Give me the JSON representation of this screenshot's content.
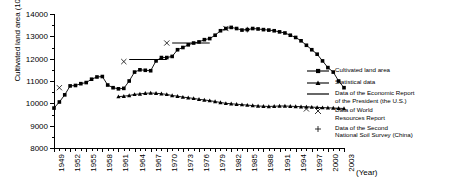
{
  "chart_data": {
    "type": "line",
    "title": "",
    "xlabel": "(Year)",
    "ylabel": "Cultivated land area (10000 hectares)",
    "ylim": [
      8000,
      14000
    ],
    "ytick_values": [
      8000,
      9000,
      10000,
      11000,
      12000,
      13000,
      14000
    ],
    "ytick_labels": [
      "8000",
      "9000",
      "10000",
      "11000",
      "12000",
      "13000",
      "14000"
    ],
    "xlim": [
      1949,
      2003
    ],
    "xtick_labels": [
      "1949",
      "1952",
      "1955",
      "1958",
      "1961",
      "1964",
      "1967",
      "1970",
      "1973",
      "1976",
      "1979",
      "1982",
      "1985",
      "1988",
      "1991",
      "1994",
      "1997",
      "2000",
      "2003"
    ],
    "grid": false,
    "legend_position": "right",
    "series": [
      {
        "name": "Cultivated land area",
        "marker": "square",
        "x": [
          1949,
          1950,
          1951,
          1952,
          1953,
          1954,
          1955,
          1956,
          1957,
          1958,
          1959,
          1960,
          1961,
          1962,
          1963,
          1964,
          1965,
          1966,
          1967,
          1968,
          1969,
          1970,
          1971,
          1972,
          1973,
          1974,
          1975,
          1976,
          1977,
          1978,
          1979,
          1980,
          1981,
          1982,
          1983,
          1984,
          1985,
          1986,
          1987,
          1988,
          1989,
          1990,
          1991,
          1992,
          1993,
          1994,
          1995,
          1996,
          1997,
          1998,
          1999,
          2000,
          2001,
          2002,
          2003
        ],
        "values": [
          9788,
          10060,
          10380,
          10780,
          10800,
          10880,
          10930,
          11080,
          11180,
          11200,
          10820,
          10700,
          10650,
          10670,
          11000,
          11400,
          11500,
          11480,
          11460,
          11900,
          12050,
          12050,
          12100,
          12400,
          12500,
          12620,
          12700,
          12750,
          12850,
          12900,
          13050,
          13250,
          13350,
          13400,
          13350,
          13280,
          13300,
          13350,
          13330,
          13300,
          13280,
          13250,
          13200,
          13150,
          13050,
          12950,
          12800,
          12600,
          12400,
          12200,
          11900,
          11600,
          11400,
          11000,
          10700
        ]
      },
      {
        "name": "Statistical data",
        "marker": "triangle",
        "x": [
          1961,
          1962,
          1963,
          1964,
          1965,
          1966,
          1967,
          1968,
          1969,
          1970,
          1971,
          1972,
          1973,
          1974,
          1975,
          1976,
          1977,
          1978,
          1979,
          1980,
          1981,
          1982,
          1983,
          1984,
          1985,
          1986,
          1987,
          1988,
          1989,
          1990,
          1991,
          1992,
          1993,
          1994,
          1995,
          1996,
          1997,
          1998,
          1999,
          2000,
          2001,
          2002,
          2003
        ],
        "values": [
          10300,
          10320,
          10350,
          10400,
          10420,
          10450,
          10460,
          10450,
          10430,
          10400,
          10350,
          10320,
          10280,
          10250,
          10220,
          10180,
          10150,
          10120,
          10080,
          10040,
          10000,
          9980,
          9960,
          9940,
          9920,
          9900,
          9880,
          9870,
          9860,
          9870,
          9880,
          9880,
          9870,
          9860,
          9850,
          9840,
          9830,
          9820,
          9810,
          9800,
          9790,
          9780,
          9770
        ]
      }
    ],
    "annotations": [
      {
        "type": "hline",
        "label": "Data of the Economic Report of the President (the U.S.)",
        "x_start": 1963,
        "x_end": 1970,
        "value": 11960
      },
      {
        "type": "hline",
        "label": "Data of the Economic Report of the President (the U.S.)",
        "x_start": 1971,
        "x_end": 1978,
        "value": 12700
      },
      {
        "type": "marker-x",
        "label": "Data of World Resources Report",
        "x": 1950,
        "value": 10700
      },
      {
        "type": "marker-x",
        "label": "Data of World Resources Report",
        "x": 1962,
        "value": 11870
      },
      {
        "type": "marker-x",
        "label": "Data of World Resources Report",
        "x": 1970,
        "value": 12700
      },
      {
        "type": "marker-x",
        "label": "Data of World Resources Report",
        "x": 1981,
        "value": 13350
      },
      {
        "type": "marker-x",
        "label": "Data of World Resources Report",
        "x": 1996,
        "value": 9750
      },
      {
        "type": "marker-plus",
        "label": "Data of the Second National Soil Survey (China)",
        "x": 1985,
        "value": 13300
      }
    ]
  },
  "legend": {
    "items": [
      {
        "key": "line-square",
        "label": "Cultivated land area"
      },
      {
        "key": "line-triangle",
        "label": "Statistical data"
      },
      {
        "key": "line-plain",
        "label": "Data of the Economic Report\nof the President (the U.S.)"
      },
      {
        "key": "marker-x",
        "label": "Data of World\nResources Report"
      },
      {
        "key": "marker-plus",
        "label": "Data of the Second\nNational Soil Survey (China)"
      }
    ]
  },
  "colors": {
    "axis": "#000000",
    "series": "#000000",
    "background": "#ffffff"
  }
}
